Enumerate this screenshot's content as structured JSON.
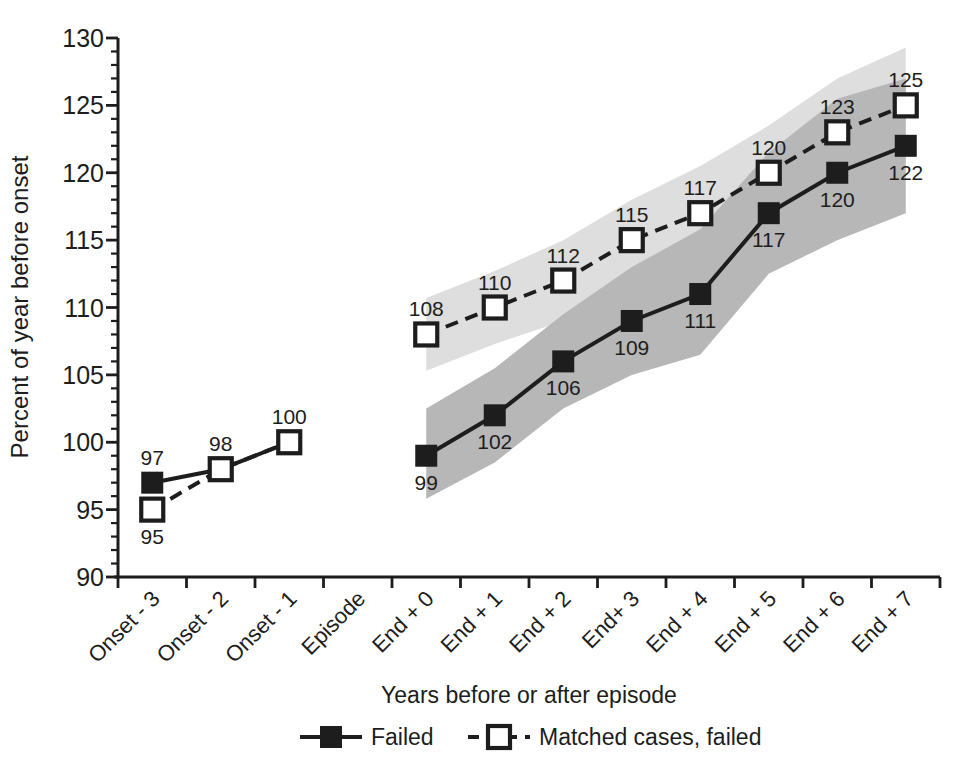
{
  "chart_data": {
    "type": "line",
    "title": "",
    "xlabel": "Years before or after episode",
    "ylabel": "Percent of year before onset",
    "ylim": [
      90,
      130
    ],
    "y_major_ticks": [
      90,
      95,
      100,
      105,
      110,
      115,
      120,
      125,
      130
    ],
    "y_minor_step": 1,
    "y_major_step": 5,
    "grid": "off",
    "categories": [
      "Onset - 3",
      "Onset - 2",
      "Onset - 1",
      "Episode",
      "End + 0",
      "End + 1",
      "End + 2",
      "End+ 3",
      "End + 4",
      "End + 5",
      "End + 6",
      "End + 7"
    ],
    "series": [
      {
        "name": "Failed",
        "marker": "filled-square",
        "line": "solid",
        "values": [
          97,
          98,
          100,
          null,
          99,
          102,
          106,
          109,
          111,
          117,
          120,
          122
        ],
        "label_positions": [
          "above",
          null,
          null,
          null,
          "below",
          "below",
          "below",
          "below",
          "below",
          "below",
          "below",
          "below"
        ]
      },
      {
        "name": "Matched cases, failed",
        "marker": "open-square",
        "line": "dashed",
        "values": [
          95,
          98,
          100,
          null,
          108,
          110,
          112,
          115,
          117,
          120,
          123,
          125
        ],
        "label_positions": [
          "below",
          "above",
          "above",
          null,
          "above",
          "above",
          "above",
          "above",
          "above",
          "above",
          "above",
          "above"
        ]
      }
    ],
    "bands": [
      {
        "series": "Matched cases, failed",
        "start_index": 4,
        "lower": [
          105.3,
          107.3,
          109.0,
          112.0,
          113.5,
          116.5,
          119.0,
          120.7
        ],
        "upper": [
          110.7,
          112.7,
          115.0,
          118.0,
          120.5,
          123.5,
          127.0,
          129.3
        ]
      },
      {
        "series": "Failed",
        "start_index": 4,
        "lower": [
          95.8,
          98.5,
          102.5,
          105.0,
          106.5,
          112.5,
          115.0,
          117.0
        ],
        "upper": [
          102.5,
          105.5,
          109.5,
          113.0,
          115.8,
          121.5,
          125.5,
          127.0
        ]
      }
    ],
    "legend": {
      "position": "bottom",
      "entries": [
        {
          "label": "Failed",
          "marker": "filled-square",
          "line": "solid"
        },
        {
          "label": "Matched cases, failed",
          "marker": "open-square",
          "line": "dashed"
        }
      ]
    },
    "colors": {
      "ink": "#1d1d1d",
      "band_failed": "#b7b7b7",
      "band_matched": "#dedede",
      "open_marker_fill": "#ffffff",
      "background": "#ffffff"
    }
  }
}
